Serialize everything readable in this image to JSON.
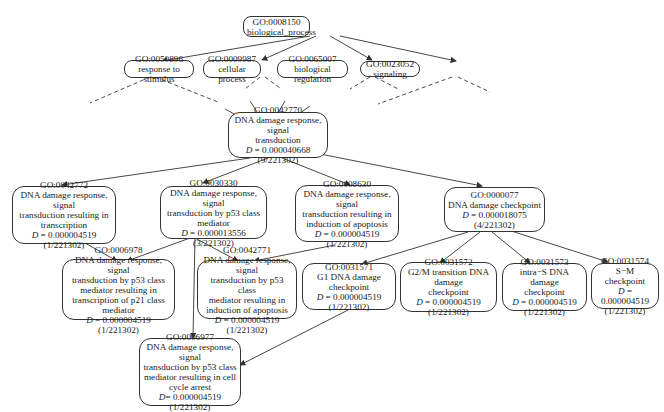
{
  "nodes": {
    "n8150": {
      "id": "GO:0008150",
      "name": "biological_process"
    },
    "n50896": {
      "id": "GO:0050896",
      "name": "response to stimulus"
    },
    "n9987": {
      "id": "GO:0009987",
      "name": "cellular process"
    },
    "n65007": {
      "id": "GO:0065007",
      "name": "biological regulation"
    },
    "n23052": {
      "id": "GO:0023052",
      "name": "signaling"
    },
    "n42770": {
      "id": "GO:0042770",
      "name1": "DNA damage response, signal",
      "name2": "transduction",
      "d_label": "D",
      "d_value": " = 0.000040668",
      "count": "(9/221302)"
    },
    "n42772": {
      "id": "GO:0042772",
      "name1": "DNA damage response, signal",
      "name2": "transduction resulting in",
      "name3": "transcription",
      "d_label": "D",
      "d_value": " = 0.000004519",
      "count": "(1/221302)"
    },
    "n30330": {
      "id": "GO:0030330",
      "name1": "DNA damage response, signal",
      "name2": "transduction by p53 class",
      "name3": "mediator",
      "d_label": "D",
      "d_value": " = 0.000013556",
      "count": "(3/221302)"
    },
    "n8630": {
      "id": "GO:0008630",
      "name1": "DNA damage response, signal",
      "name2": "transduction resulting in",
      "name3": "induction of apoptosis",
      "d_label": "D",
      "d_value": " = 0.000004519",
      "count": "(1/221302)"
    },
    "n77": {
      "id": "GO:0000077",
      "name1": "DNA damage checkpoint",
      "d_label": "D",
      "d_value": " = 0.000018075",
      "count": "(4/221302)"
    },
    "n6978": {
      "id": "GO:0006978",
      "name1": "DNA damage response, signal",
      "name2": "transduction by p53 class",
      "name3": "mediator resulting in",
      "name4": "transcription of p21 class mediator",
      "d_label": "D",
      "d_value": " = 0.000004519",
      "count": "(1/221302)"
    },
    "n42771": {
      "id": "GO:0042771",
      "name1": "DNA damage response, signal",
      "name2": "transduction by p53 class",
      "name3": "mediator resulting in",
      "name4": "induction of apoptosis",
      "d_label": "D",
      "d_value": " = 0.000004519",
      "count": "(1/221302)"
    },
    "n31571": {
      "id": "GO:0031571",
      "name1": "G1 DNA damage checkpoint",
      "d_label": "D",
      "d_value": " = 0.000004519",
      "count": "(1/221302)"
    },
    "n31572": {
      "id": "GO:0031572",
      "name1": "G2/M transition DNA damage",
      "name2": "checkpoint",
      "d_label": "D",
      "d_value": " = 0.000004519",
      "count": "(1/221302)"
    },
    "n31573": {
      "id": "GO:0031573",
      "name1": "intra−S DNA damage",
      "name2": "checkpoint",
      "d_label": "D",
      "d_value": " = 0.000004519",
      "count": "(1/221302)"
    },
    "n31574": {
      "id": "GO:0031574",
      "name1": "S−M checkpoint",
      "d_label": "D",
      "d_value": " = 0.000004519",
      "count": "(1/221302)"
    },
    "n6977": {
      "id": "GO:0006977",
      "name1": "DNA damage response, signal",
      "name2": "transduction by p53 class",
      "name3": "mediator resulting in cell",
      "name4": "cycle arrest",
      "d_label": "D",
      "d_value": "= 0.000004519",
      "count": "(1/221302)"
    }
  },
  "colors": {
    "edge": "#333333",
    "border": "#333333",
    "background": "#ffffff"
  }
}
